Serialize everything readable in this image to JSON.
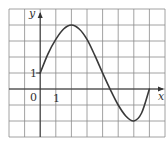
{
  "chart_data": {
    "type": "line",
    "title": "",
    "xlabel": "x",
    "ylabel": "y",
    "xlim": [
      -2,
      8
    ],
    "ylim": [
      -3,
      5
    ],
    "grid": true,
    "tick_labels": {
      "x": [
        "0",
        "1"
      ],
      "y": [
        "1"
      ]
    },
    "series": [
      {
        "name": "f(x)",
        "x": [
          0,
          0.5,
          1,
          1.5,
          2,
          2.5,
          3,
          3.5,
          4,
          4.5,
          5,
          5.5,
          6,
          6.5,
          7
        ],
        "y": [
          1,
          2.2,
          3.1,
          3.75,
          4,
          3.75,
          3.1,
          2.1,
          1,
          -0.05,
          -1,
          -1.7,
          -2,
          -1.5,
          0
        ]
      }
    ],
    "annotations": [
      {
        "text": "0",
        "at": "origin"
      },
      {
        "text": "1",
        "at": "x-tick-1"
      },
      {
        "text": "1",
        "at": "y-tick-1"
      }
    ]
  },
  "labels": {
    "y_axis": "y",
    "x_axis": "x",
    "origin": "0",
    "x_tick_1": "1",
    "y_tick_1": "1"
  },
  "layout": {
    "left": 9,
    "top": 9,
    "right": 165,
    "bottom": 137,
    "cols": 10,
    "rows": 8,
    "origin_col": 2,
    "origin_row": 5
  }
}
